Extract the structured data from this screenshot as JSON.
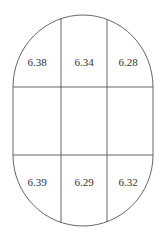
{
  "diagram": {
    "shape": "stadium",
    "stroke_color": "#555555",
    "text_color": "#333333",
    "rows": [
      {
        "position": "top",
        "cells": [
          {
            "column": "left",
            "value": "6.38"
          },
          {
            "column": "center",
            "value": "6.34"
          },
          {
            "column": "right",
            "value": "6.28"
          }
        ]
      },
      {
        "position": "middle",
        "cells": [
          {
            "column": "left",
            "value": ""
          },
          {
            "column": "center",
            "value": ""
          },
          {
            "column": "right",
            "value": ""
          }
        ]
      },
      {
        "position": "bottom",
        "cells": [
          {
            "column": "left",
            "value": "6.39"
          },
          {
            "column": "center",
            "value": "6.29"
          },
          {
            "column": "right",
            "value": "6.32"
          }
        ]
      }
    ]
  }
}
